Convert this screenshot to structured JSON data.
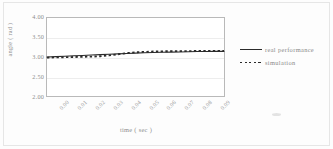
{
  "chart_data": {
    "type": "line",
    "title": "",
    "xlabel": "time ( sec )",
    "ylabel": "angle ( rad )",
    "xlim": [
      0.0,
      0.1
    ],
    "ylim": [
      2.0,
      4.0
    ],
    "grid": true,
    "legend_position": "right",
    "y_ticks": [
      "4.00",
      "3.50",
      "3.00",
      "2.50",
      "2.00"
    ],
    "y_tick_values": [
      4.0,
      3.5,
      3.0,
      2.5,
      2.0
    ],
    "x_ticks": [
      "0.00",
      "0.01",
      "0.02",
      "0.03",
      "0.04",
      "0.05",
      "0.06",
      "0.07",
      "0.08",
      "0.09"
    ],
    "x_tick_values": [
      0.0,
      0.01,
      0.02,
      0.03,
      0.04,
      0.05,
      0.06,
      0.07,
      0.08,
      0.09
    ],
    "x": [
      0.0,
      0.005,
      0.01,
      0.015,
      0.02,
      0.025,
      0.03,
      0.035,
      0.04,
      0.045,
      0.05,
      0.055,
      0.06,
      0.065,
      0.07,
      0.075,
      0.08,
      0.085,
      0.09,
      0.095,
      0.1
    ],
    "series": [
      {
        "name": "real performance",
        "style": "solid",
        "color": "#2b2b2b",
        "values": [
          3.0,
          3.01,
          3.02,
          3.03,
          3.04,
          3.05,
          3.06,
          3.07,
          3.08,
          3.09,
          3.1,
          3.11,
          3.115,
          3.12,
          3.125,
          3.13,
          3.135,
          3.14,
          3.14,
          3.145,
          3.145
        ]
      },
      {
        "name": "simulation",
        "style": "dotted",
        "color": "#2b2b2b",
        "values": [
          2.985,
          2.99,
          2.995,
          3.0,
          3.005,
          3.01,
          3.02,
          3.04,
          3.07,
          3.1,
          3.12,
          3.13,
          3.14,
          3.145,
          3.15,
          3.15,
          3.152,
          3.153,
          3.153,
          3.154,
          3.154
        ]
      }
    ],
    "legend": [
      {
        "label": "real performance",
        "style": "solid"
      },
      {
        "label": "simulation",
        "style": "dotted"
      }
    ]
  }
}
